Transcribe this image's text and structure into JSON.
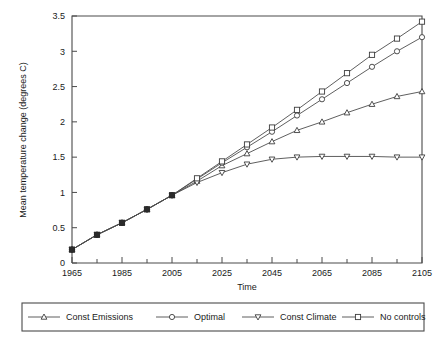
{
  "chart_data": {
    "type": "line",
    "title": "",
    "xlabel": "Time",
    "ylabel": "Mean temperature change (degrees C)",
    "xlim": [
      1965,
      2105
    ],
    "ylim": [
      0,
      3.5
    ],
    "xticks": [
      1965,
      1985,
      2005,
      2025,
      2045,
      2065,
      2085,
      2105
    ],
    "xticklabels": [
      "1965",
      "1985",
      "2005",
      "2025",
      "2045",
      "2065",
      "2085",
      "2105"
    ],
    "xminorticks": [
      1975,
      1995,
      2015,
      2035,
      2055,
      2075,
      2095
    ],
    "yticks": [
      0,
      0.5,
      1,
      1.5,
      2,
      2.5,
      3,
      3.5
    ],
    "yticklabels": [
      "0",
      "0.5",
      "1",
      "1.5",
      "2",
      "2.5",
      "3",
      "3.5"
    ],
    "grid": false,
    "legend_position": "below-outside",
    "x": [
      1965,
      1975,
      1985,
      1995,
      2005,
      2015,
      2025,
      2035,
      2045,
      2055,
      2065,
      2075,
      2085,
      2095,
      2105
    ],
    "series": [
      {
        "name": "Const Emissions",
        "marker": "triangle-up",
        "values": [
          0.19,
          0.4,
          0.57,
          0.76,
          0.96,
          1.16,
          1.38,
          1.55,
          1.72,
          1.88,
          2.0,
          2.13,
          2.25,
          2.36,
          2.43
        ]
      },
      {
        "name": "Optimal",
        "marker": "circle",
        "values": [
          0.19,
          0.4,
          0.57,
          0.76,
          0.96,
          1.19,
          1.42,
          1.64,
          1.86,
          2.09,
          2.32,
          2.55,
          2.78,
          3.0,
          3.2
        ]
      },
      {
        "name": "Const Climate",
        "marker": "triangle-down",
        "values": [
          0.19,
          0.4,
          0.57,
          0.76,
          0.96,
          1.14,
          1.28,
          1.4,
          1.47,
          1.5,
          1.51,
          1.51,
          1.51,
          1.5,
          1.5
        ]
      },
      {
        "name": "No controls",
        "marker": "square",
        "values": [
          0.19,
          0.4,
          0.57,
          0.76,
          0.96,
          1.2,
          1.44,
          1.68,
          1.92,
          2.17,
          2.43,
          2.69,
          2.95,
          3.18,
          3.42
        ]
      }
    ]
  },
  "legend": {
    "items": [
      {
        "label": "Const Emissions",
        "marker": "triangle-up-icon"
      },
      {
        "label": "Optimal",
        "marker": "circle-icon"
      },
      {
        "label": "Const Climate",
        "marker": "triangle-down-icon"
      },
      {
        "label": "No controls",
        "marker": "square-icon"
      }
    ]
  },
  "colors": {
    "line": "#4d4d4d",
    "axis": "#4a4a4a",
    "text": "#1a1a1a",
    "marker_fill": "#ffffff"
  }
}
